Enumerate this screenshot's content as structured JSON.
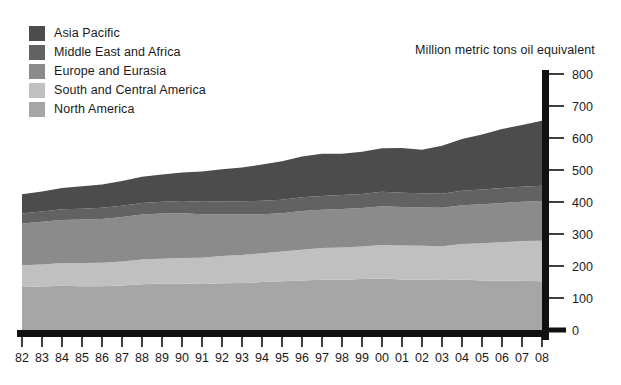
{
  "legend": {
    "items": [
      {
        "label": "Asia Pacific",
        "color": "#4c4c4c"
      },
      {
        "label": "Middle East and Africa",
        "color": "#626262"
      },
      {
        "label": "Europe and Eurasia",
        "color": "#8b8b8b"
      },
      {
        "label": "South and Central America",
        "color": "#c0c0c0"
      },
      {
        "label": "North America",
        "color": "#a6a6a6"
      }
    ]
  },
  "axis_title": "Million metric tons oil equivalent",
  "chart_data": {
    "type": "area",
    "stacked": true,
    "title": "",
    "subtitle": "",
    "xlabel": "",
    "ylabel": "Million metric tons oil equivalent",
    "ylim": [
      0,
      800
    ],
    "yticks": [
      0,
      100,
      200,
      300,
      400,
      500,
      600,
      700,
      800
    ],
    "grid": false,
    "legend_position": "top-left",
    "categories": [
      "82",
      "83",
      "84",
      "85",
      "86",
      "87",
      "88",
      "89",
      "90",
      "91",
      "92",
      "93",
      "94",
      "95",
      "96",
      "97",
      "98",
      "99",
      "00",
      "01",
      "02",
      "03",
      "04",
      "05",
      "06",
      "07",
      "08"
    ],
    "series": [
      {
        "name": "North America",
        "color": "#a6a6a6",
        "values": [
          134,
          136,
          138,
          137,
          137,
          139,
          143,
          145,
          145,
          144,
          146,
          147,
          150,
          152,
          155,
          157,
          157,
          159,
          161,
          158,
          158,
          156,
          158,
          155,
          154,
          154,
          152
        ]
      },
      {
        "name": "South and Central America",
        "color": "#c0c0c0",
        "values": [
          68,
          69,
          71,
          72,
          73,
          75,
          77,
          78,
          80,
          82,
          85,
          87,
          90,
          93,
          96,
          99,
          101,
          102,
          105,
          106,
          105,
          106,
          111,
          116,
          120,
          124,
          127
        ]
      },
      {
        "name": "Europe and Eurasia",
        "color": "#8b8b8b",
        "values": [
          131,
          133,
          135,
          136,
          137,
          139,
          141,
          141,
          140,
          136,
          131,
          127,
          122,
          120,
          121,
          120,
          120,
          120,
          121,
          120,
          120,
          120,
          121,
          122,
          123,
          123,
          124
        ]
      },
      {
        "name": "Middle East and Africa",
        "color": "#626262",
        "values": [
          31,
          32,
          33,
          34,
          35,
          35,
          36,
          37,
          38,
          39,
          40,
          41,
          42,
          42,
          43,
          43,
          44,
          44,
          45,
          45,
          44,
          44,
          45,
          46,
          47,
          47,
          48
        ]
      },
      {
        "name": "Asia Pacific",
        "color": "#4c4c4c",
        "values": [
          60,
          63,
          67,
          70,
          73,
          78,
          82,
          85,
          89,
          94,
          100,
          106,
          113,
          120,
          127,
          132,
          129,
          132,
          136,
          140,
          136,
          150,
          162,
          172,
          184,
          193,
          203
        ]
      }
    ],
    "totals": [
      424,
      433,
      444,
      449,
      455,
      466,
      479,
      486,
      492,
      495,
      502,
      508,
      517,
      527,
      542,
      551,
      551,
      557,
      568,
      569,
      563,
      576,
      597,
      611,
      628,
      641,
      654
    ]
  }
}
